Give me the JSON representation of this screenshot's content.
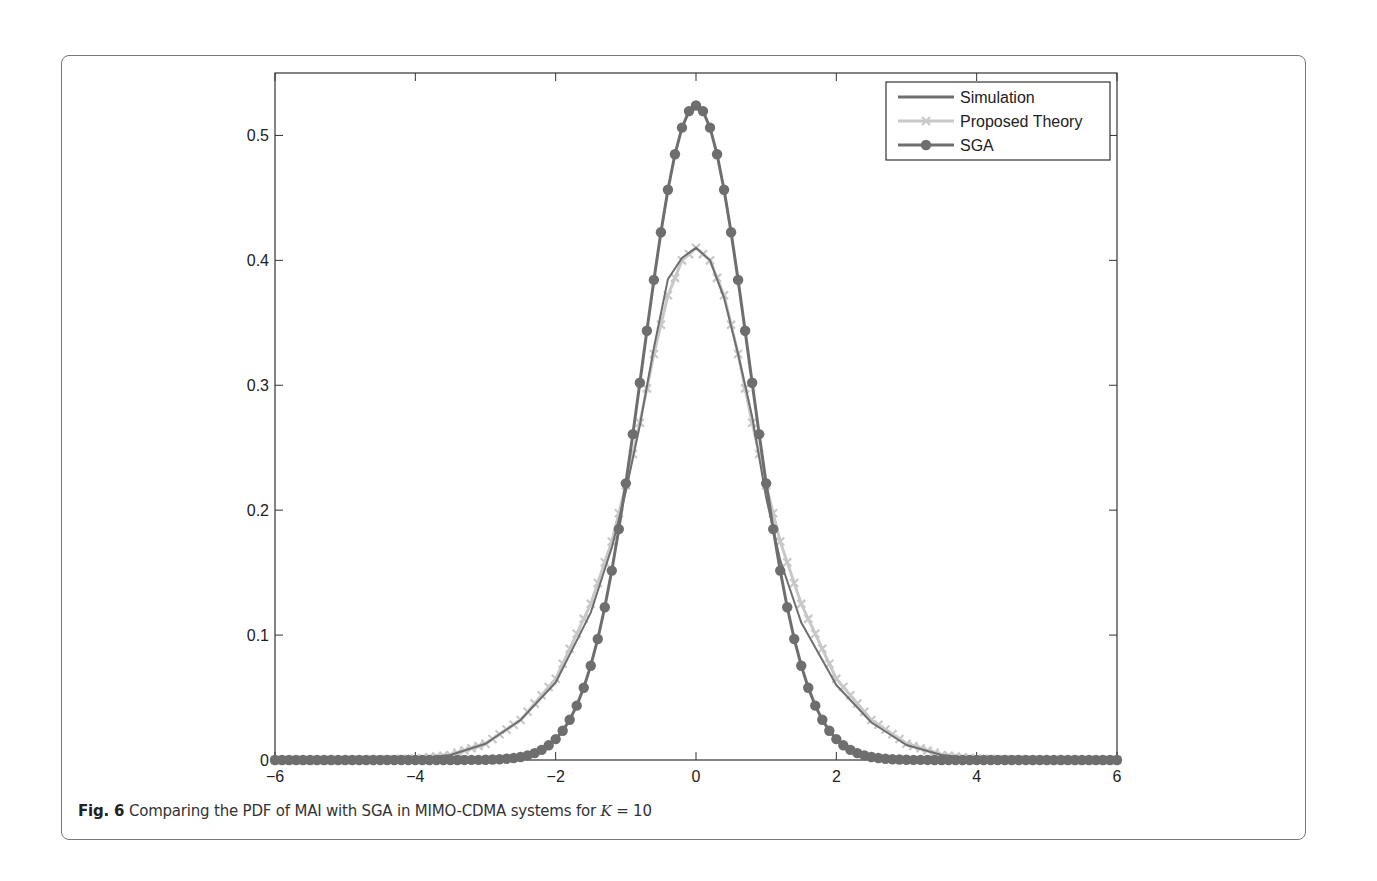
{
  "caption": {
    "label": "Fig. 6",
    "text": "Comparing the PDF of MAI with SGA in MIMO-CDMA systems for ",
    "var": "K",
    "eq": " = 10"
  },
  "chart_data": {
    "type": "line",
    "title": "",
    "xlabel": "",
    "ylabel": "",
    "xlim": [
      -6,
      6
    ],
    "ylim": [
      0,
      0.55
    ],
    "xticks": [
      -6,
      -4,
      -2,
      0,
      2,
      4,
      6
    ],
    "xtick_labels": [
      "−6",
      "−4",
      "−2",
      "0",
      "2",
      "4",
      "6"
    ],
    "yticks": [
      0,
      0.1,
      0.2,
      0.3,
      0.4,
      0.5
    ],
    "ytick_labels": [
      "0",
      "0.1",
      "0.2",
      "0.3",
      "0.4",
      "0.5"
    ],
    "grid": false,
    "legend_position": "upper right",
    "legend": [
      "Simulation",
      "Proposed Theory",
      "SGA"
    ],
    "series": [
      {
        "name": "Simulation",
        "color": "#6e6e6e",
        "marker": "none",
        "x": [
          -6,
          -5,
          -4,
          -3.5,
          -3,
          -2.5,
          -2,
          -1.5,
          -1.2,
          -1,
          -0.8,
          -0.6,
          -0.4,
          -0.2,
          0,
          0.2,
          0.4,
          0.6,
          0.8,
          1,
          1.2,
          1.5,
          2,
          2.5,
          3,
          3.5,
          4,
          5,
          6
        ],
        "y": [
          0,
          0,
          0.001,
          0.004,
          0.013,
          0.032,
          0.062,
          0.118,
          0.17,
          0.215,
          0.268,
          0.33,
          0.385,
          0.402,
          0.41,
          0.4,
          0.37,
          0.325,
          0.275,
          0.21,
          0.16,
          0.11,
          0.06,
          0.03,
          0.012,
          0.004,
          0.001,
          0,
          0
        ]
      },
      {
        "name": "Proposed Theory",
        "color": "#c8c8c8",
        "marker": "x",
        "x": [
          -6,
          -5,
          -4,
          -3.5,
          -3,
          -2.5,
          -2,
          -1.5,
          -1.2,
          -1,
          -0.8,
          -0.6,
          -0.4,
          -0.2,
          0,
          0.2,
          0.4,
          0.6,
          0.8,
          1,
          1.2,
          1.5,
          2,
          2.5,
          3,
          3.5,
          4,
          5,
          6
        ],
        "y": [
          0,
          0,
          0.001,
          0.004,
          0.013,
          0.032,
          0.065,
          0.125,
          0.175,
          0.22,
          0.27,
          0.325,
          0.372,
          0.4,
          0.41,
          0.4,
          0.372,
          0.325,
          0.27,
          0.22,
          0.175,
          0.125,
          0.065,
          0.032,
          0.013,
          0.004,
          0.001,
          0,
          0
        ]
      },
      {
        "name": "SGA",
        "color": "#6e6e6e",
        "marker": "o",
        "distribution": "gaussian",
        "mean": 0,
        "std": 0.762,
        "peak": 0.524
      }
    ]
  }
}
